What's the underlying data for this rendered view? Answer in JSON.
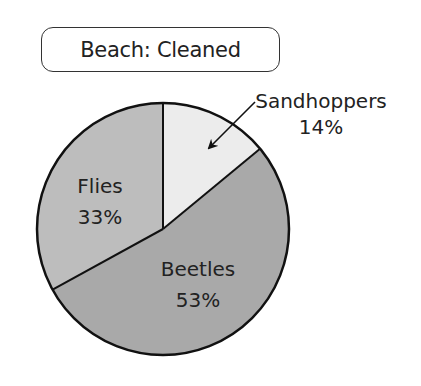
{
  "title": "Beach: Cleaned",
  "chart_data": {
    "type": "pie",
    "title": "Beach: Cleaned",
    "categories": [
      "Sandhoppers",
      "Beetles",
      "Flies"
    ],
    "values": [
      14,
      53,
      33
    ],
    "unit": "%",
    "start_angle_deg": -90,
    "direction": "clockwise",
    "colors": [
      "#ececec",
      "#a9a9a9",
      "#bdbdbd"
    ],
    "labels": [
      {
        "name": "Sandhoppers",
        "value_label": "14%",
        "placement": "outside, with arrow"
      },
      {
        "name": "Beetles",
        "value_label": "53%",
        "placement": "inside"
      },
      {
        "name": "Flies",
        "value_label": "33%",
        "placement": "inside"
      }
    ],
    "legend": "none"
  },
  "colors": {
    "outline": "#111111",
    "text": "#222222"
  }
}
